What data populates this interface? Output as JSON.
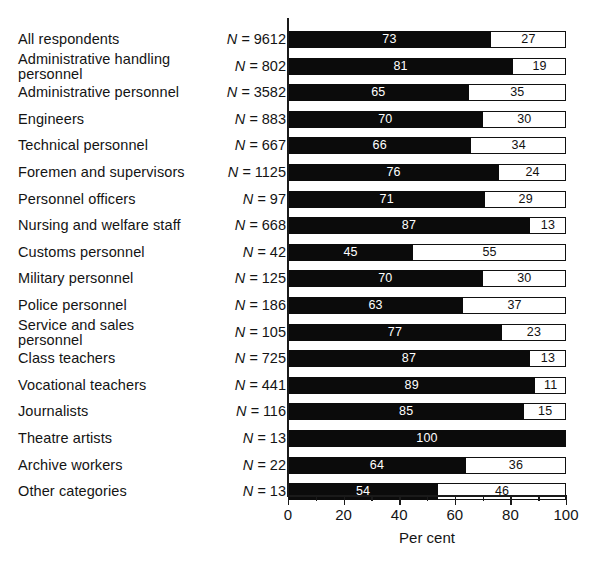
{
  "chart_data": {
    "type": "bar",
    "orientation": "horizontal",
    "stacked": true,
    "title": "",
    "xlabel": "Per cent",
    "ylabel": "",
    "xlim": [
      0,
      100
    ],
    "xticks": [
      0,
      20,
      40,
      60,
      80,
      100
    ],
    "xtick_labels": [
      "0",
      "20",
      "40",
      "60",
      "80",
      "100"
    ],
    "minor_xticks": [
      10,
      30,
      50,
      70,
      90
    ],
    "grid": false,
    "legend": null,
    "series": [
      {
        "name": "dark",
        "color": "#0b0b0b",
        "values": [
          73,
          81,
          65,
          70,
          66,
          76,
          71,
          87,
          45,
          70,
          63,
          77,
          87,
          89,
          85,
          100,
          64,
          54
        ]
      },
      {
        "name": "light",
        "color": "#ffffff",
        "values": [
          27,
          19,
          35,
          30,
          34,
          24,
          29,
          13,
          55,
          30,
          37,
          23,
          13,
          11,
          15,
          0,
          36,
          46
        ]
      }
    ],
    "categories": [
      "All respondents",
      "Administrative handling personnel",
      "Administrative personnel",
      "Engineers",
      "Technical personnel",
      "Foremen and supervisors",
      "Personnel officers",
      "Nursing and welfare staff",
      "Customs personnel",
      "Military personnel",
      "Police personnel",
      "Service and sales personnel",
      "Class teachers",
      "Vocational teachers",
      "Journalists",
      "Theatre artists",
      "Archive workers",
      "Other categories"
    ],
    "n_values": [
      9612,
      802,
      3582,
      883,
      667,
      1125,
      97,
      668,
      42,
      125,
      186,
      105,
      725,
      441,
      116,
      13,
      22,
      13
    ]
  },
  "rows": [
    {
      "label": "All respondents",
      "lines": 1,
      "n_prefix": "N =",
      "n": "9612",
      "dark": 73,
      "light": 27,
      "dark_label": "73",
      "light_label": "27"
    },
    {
      "label": "Administrative handling\npersonnel",
      "lines": 2,
      "n_prefix": "N =",
      "n": "802",
      "dark": 81,
      "light": 19,
      "dark_label": "81",
      "light_label": "19"
    },
    {
      "label": "Administrative personnel",
      "lines": 1,
      "n_prefix": "N =",
      "n": "3582",
      "dark": 65,
      "light": 35,
      "dark_label": "65",
      "light_label": "35"
    },
    {
      "label": "Engineers",
      "lines": 1,
      "n_prefix": "N =",
      "n": "883",
      "dark": 70,
      "light": 30,
      "dark_label": "70",
      "light_label": "30"
    },
    {
      "label": "Technical personnel",
      "lines": 1,
      "n_prefix": "N =",
      "n": "667",
      "dark": 66,
      "light": 34,
      "dark_label": "66",
      "light_label": "34"
    },
    {
      "label": "Foremen and supervisors",
      "lines": 1,
      "n_prefix": "N =",
      "n": "1125",
      "dark": 76,
      "light": 24,
      "dark_label": "76",
      "light_label": "24"
    },
    {
      "label": "Personnel officers",
      "lines": 1,
      "n_prefix": "N =",
      "n": "97",
      "dark": 71,
      "light": 29,
      "dark_label": "71",
      "light_label": "29"
    },
    {
      "label": "Nursing and welfare staff",
      "lines": 1,
      "n_prefix": "N =",
      "n": "668",
      "dark": 87,
      "light": 13,
      "dark_label": "87",
      "light_label": "13"
    },
    {
      "label": "Customs personnel",
      "lines": 1,
      "n_prefix": "N =",
      "n": "42",
      "dark": 45,
      "light": 55,
      "dark_label": "45",
      "light_label": "55"
    },
    {
      "label": "Military personnel",
      "lines": 1,
      "n_prefix": "N =",
      "n": "125",
      "dark": 70,
      "light": 30,
      "dark_label": "70",
      "light_label": "30"
    },
    {
      "label": "Police personnel",
      "lines": 1,
      "n_prefix": "N =",
      "n": "186",
      "dark": 63,
      "light": 37,
      "dark_label": "63",
      "light_label": "37"
    },
    {
      "label": "Service and sales\npersonnel",
      "lines": 2,
      "n_prefix": "N =",
      "n": "105",
      "dark": 77,
      "light": 23,
      "dark_label": "77",
      "light_label": "23"
    },
    {
      "label": "Class teachers",
      "lines": 1,
      "n_prefix": "N =",
      "n": "725",
      "dark": 87,
      "light": 13,
      "dark_label": "87",
      "light_label": "13"
    },
    {
      "label": "Vocational teachers",
      "lines": 1,
      "n_prefix": "N =",
      "n": "441",
      "dark": 89,
      "light": 11,
      "dark_label": "89",
      "light_label": "11"
    },
    {
      "label": "Journalists",
      "lines": 1,
      "n_prefix": "N =",
      "n": "116",
      "dark": 85,
      "light": 15,
      "dark_label": "85",
      "light_label": "15"
    },
    {
      "label": "Theatre artists",
      "lines": 1,
      "n_prefix": "N =",
      "n": "13",
      "dark": 100,
      "light": 0,
      "dark_label": "100",
      "light_label": ""
    },
    {
      "label": "Archive workers",
      "lines": 1,
      "n_prefix": "N =",
      "n": "22",
      "dark": 64,
      "light": 36,
      "dark_label": "64",
      "light_label": "36"
    },
    {
      "label": "Other categories",
      "lines": 1,
      "n_prefix": "N =",
      "n": "13",
      "dark": 54,
      "light": 46,
      "dark_label": "54",
      "light_label": "46"
    }
  ],
  "axis": {
    "title": "Per cent",
    "ticks": [
      {
        "value": 0,
        "label": "0"
      },
      {
        "value": 20,
        "label": "20"
      },
      {
        "value": 40,
        "label": "40"
      },
      {
        "value": 60,
        "label": "60"
      },
      {
        "value": 80,
        "label": "80"
      },
      {
        "value": 100,
        "label": "100"
      }
    ],
    "minor_ticks": [
      10,
      30,
      50,
      70,
      90
    ]
  },
  "colors": {
    "dark_segment": "#0b0b0b",
    "light_segment": "#ffffff",
    "outline": "#111111",
    "text": "#141414",
    "background": "#ffffff"
  }
}
